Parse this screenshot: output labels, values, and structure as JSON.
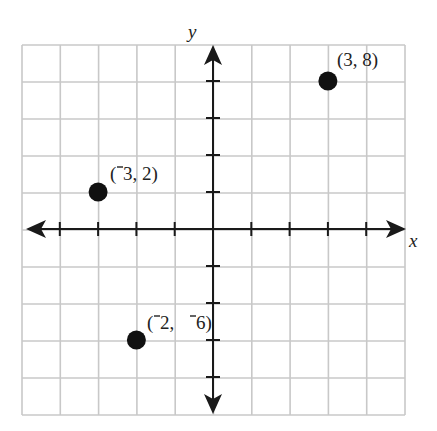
{
  "chart_data": {
    "type": "scatter",
    "title": "",
    "xlabel": "x",
    "ylabel": "y",
    "xlim": [
      -5,
      5
    ],
    "ylim": [
      -10,
      10
    ],
    "x_tick_step": 1,
    "y_tick_step": 2,
    "grid": true,
    "points": [
      {
        "x": 3,
        "y": 8,
        "label": "(3, 8)"
      },
      {
        "x": -3,
        "y": 2,
        "label": "(‾3, 2)"
      },
      {
        "x": -2,
        "y": -6,
        "label": "(‾2, ‾6)"
      }
    ]
  },
  "labels": {
    "x_axis": "x",
    "y_axis": "y",
    "p1": "(3, 8)",
    "p2_open": "(",
    "p2_rest": "3, 2)",
    "p3_open": "(",
    "p3_mid": "2, ",
    "p3_rest": "6)"
  },
  "colors": {
    "grid": "#c8c8c8",
    "axis": "#1a1a1a",
    "point": "#111111"
  }
}
